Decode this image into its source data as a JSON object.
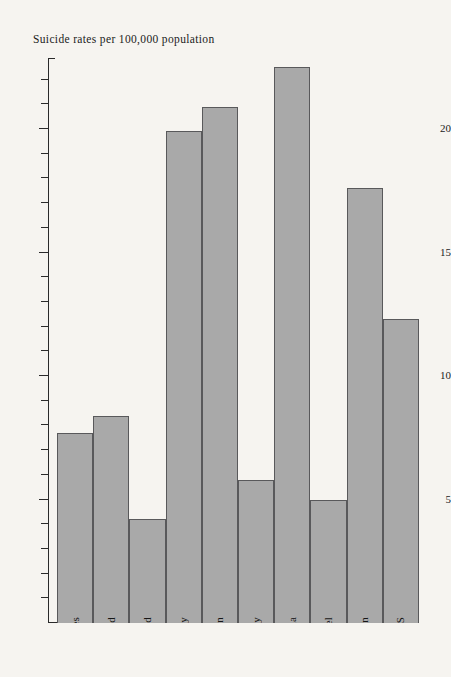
{
  "page": {
    "background_color": "#f6f4f0"
  },
  "chart_data": {
    "type": "bar",
    "title": "Suicide rates per 100,000 population",
    "xlabel": "",
    "ylabel": "",
    "ylim": [
      0,
      23
    ],
    "grid": false,
    "legend": "none",
    "orientation": "vertical",
    "bar_color": "#a9a9a9",
    "bar_border_color": "#59595b",
    "axis_color": "#2a2a2a",
    "y_tick_major_values": [
      5,
      10,
      15,
      20
    ],
    "y_tick_major_labels": [
      "5",
      "10",
      "15",
      "20"
    ],
    "y_tick_minor_step": 1,
    "categories": [
      "England and Wales",
      "Scotland",
      "Northern Ireland",
      "West Germany",
      "Sweden",
      "Italy",
      "Czechoslovakia",
      "Israel",
      "Japan",
      "US"
    ],
    "values": [
      7.7,
      8.4,
      4.2,
      19.9,
      20.9,
      5.8,
      22.5,
      5.0,
      17.6,
      12.3
    ]
  }
}
